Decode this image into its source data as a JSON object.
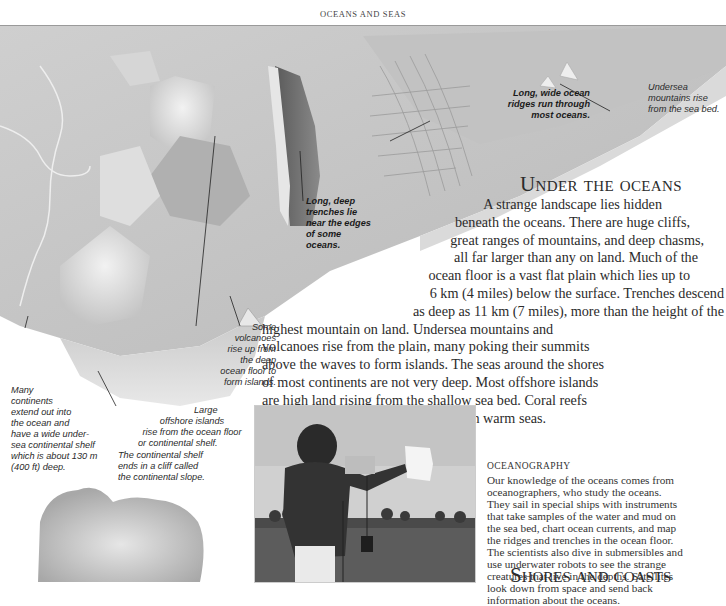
{
  "header": {
    "running_title": "OCEANS AND SEAS"
  },
  "illustration": {
    "name": "ocean-floor-relief",
    "captions": {
      "ridges": "Long, wide ocean ridges run through most oceans.",
      "ridges_lines": [
        "Long, wide ocean",
        "ridges run through",
        "most oceans."
      ],
      "mountains_lines": [
        "Undersea",
        "mountains rise",
        "from the sea bed."
      ],
      "trenches_lines": [
        "Long, deep",
        "trenches lie",
        "near the edges",
        "of some",
        "oceans."
      ],
      "volcanoes_lines": [
        "Some",
        "volcanoes",
        "rise up from",
        "the deep",
        "ocean floor to",
        "form islands."
      ],
      "continents_lines": [
        "Many",
        "continents",
        "extend out into",
        "the ocean and",
        "have a wide under-",
        "sea continental shelf",
        "which is about 130 m",
        "(400 ft) deep."
      ],
      "islands_lines": [
        "Large",
        "offshore islands",
        "rise from the ocean floor",
        "or continental shelf."
      ],
      "slope_lines": [
        "The continental shelf",
        "ends in a cliff called",
        "the continental slope."
      ]
    }
  },
  "under_the_oceans": {
    "heading": "Under the oceans",
    "lines": [
      "A strange landscape lies hidden",
      "beneath the oceans. There are huge cliffs,",
      "great ranges of mountains, and deep chasms,",
      "all far larger than any on land. Much of the",
      "ocean floor is a vast flat plain which lies up to",
      "6 km (4 miles) below the surface. Trenches descend",
      "as deep as 11 km (7 miles), more than the height of the",
      "highest mountain on land. Undersea mountains and",
      "volcanoes rise from the plain, many poking their summits",
      "above the waves to form islands. The seas around the shores",
      "of most continents are not very deep. Most offshore islands",
      "are high land rising from the shallow sea bed. Coral reefs",
      "and atolls grow up from the sea bed in warm seas."
    ]
  },
  "photo": {
    "subject": "oceanographer-with-instrument-photo"
  },
  "oceanography": {
    "heading": "OCEANOGRAPHY",
    "lines": [
      "Our knowledge of the oceans comes from",
      "oceanographers, who study the oceans.",
      "They sail in special ships with instruments",
      "that take samples of the water and mud on",
      "the sea bed, chart ocean currents, and map",
      "the ridges and trenches in the ocean floor.",
      "The scientists also dive in submersibles and",
      "use underwater robots to see the strange",
      "creatures that live in the depths. Satellites",
      "look down from space and send back",
      "information about the oceans."
    ]
  },
  "shores": {
    "heading": "Shores and coasts"
  }
}
